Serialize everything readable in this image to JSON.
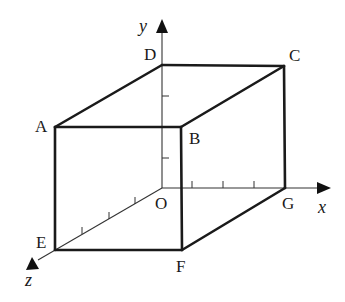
{
  "figure": {
    "type": "3d-cuboid-on-coordinate-axes",
    "vertices": {
      "O": {
        "label": "O",
        "x": 162,
        "y": 188,
        "label_x": 154,
        "label_y": 211
      },
      "A": {
        "label": "A",
        "x": 55,
        "y": 127,
        "label_x": 35,
        "label_y": 132
      },
      "B": {
        "label": "B",
        "x": 181,
        "y": 127,
        "label_x": 189,
        "label_y": 144
      },
      "C": {
        "label": "C",
        "x": 284,
        "y": 66,
        "label_x": 289,
        "label_y": 61
      },
      "D": {
        "label": "D",
        "x": 162,
        "y": 65,
        "label_x": 144,
        "label_y": 60
      },
      "E": {
        "label": "E",
        "x": 55,
        "y": 250,
        "label_x": 36,
        "label_y": 246
      },
      "F": {
        "label": "F",
        "x": 182,
        "y": 250,
        "label_x": 176,
        "label_y": 272
      },
      "G": {
        "label": "G",
        "x": 285,
        "y": 188,
        "label_x": 282,
        "label_y": 211
      }
    },
    "edges": [
      [
        "A",
        "B"
      ],
      [
        "B",
        "F"
      ],
      [
        "F",
        "E"
      ],
      [
        "E",
        "A"
      ],
      [
        "A",
        "D"
      ],
      [
        "D",
        "C"
      ],
      [
        "C",
        "B"
      ],
      [
        "C",
        "G"
      ],
      [
        "G",
        "F"
      ]
    ],
    "axes": {
      "x": {
        "label": "x",
        "label_x": 318,
        "label_y": 214,
        "ticks": 3
      },
      "y": {
        "label": "y",
        "label_x": 140,
        "label_y": 32,
        "ticks": 2
      },
      "z": {
        "label": "z",
        "label_x": 24,
        "label_y": 285,
        "ticks": 3
      }
    },
    "colors": {
      "line": "#1a1a1a",
      "axis": "#333333",
      "background": "#ffffff"
    }
  }
}
